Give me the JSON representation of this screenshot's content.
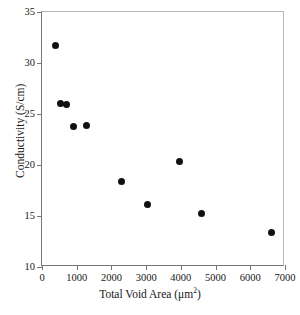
{
  "chart_data": {
    "type": "scatter",
    "title": "",
    "xlabel": "Total Void Area (μm",
    "xlabel_sup": "2",
    "xlabel_close": ")",
    "ylabel": "Conductivity (S/cm)",
    "xlim": [
      0,
      7000
    ],
    "ylim": [
      10,
      35
    ],
    "xticks": [
      0,
      1000,
      2000,
      3000,
      4000,
      5000,
      6000,
      7000
    ],
    "yticks": [
      10,
      15,
      20,
      25,
      30,
      35
    ],
    "xtick_labels": [
      "0",
      "1000",
      "2000",
      "3000",
      "4000",
      "5000",
      "6000",
      "7000"
    ],
    "ytick_labels": [
      "10",
      "15",
      "20",
      "25",
      "30",
      "35"
    ],
    "grid": false,
    "legend": null,
    "marker": "filled-circle",
    "marker_color": "#111111",
    "points": [
      {
        "x": 400,
        "y": 31.7
      },
      {
        "x": 520,
        "y": 26.0
      },
      {
        "x": 720,
        "y": 25.9
      },
      {
        "x": 920,
        "y": 23.8
      },
      {
        "x": 1270,
        "y": 23.9
      },
      {
        "x": 2280,
        "y": 18.4
      },
      {
        "x": 3030,
        "y": 16.1
      },
      {
        "x": 3950,
        "y": 20.3
      },
      {
        "x": 4590,
        "y": 15.2
      },
      {
        "x": 6600,
        "y": 13.4
      }
    ]
  }
}
